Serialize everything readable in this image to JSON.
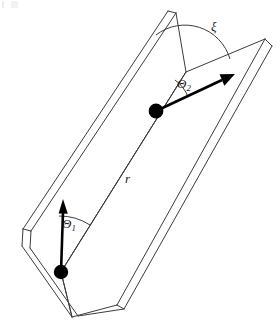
{
  "figure": {
    "type": "geometry-diagram",
    "title": "",
    "background_color": "#ffffff",
    "line_color": "#3c3c3c",
    "vector_color": "#000000",
    "particle_color": "#000000",
    "label_color": "#1a1a1a"
  },
  "labels": {
    "theta1": {
      "symbol": "Θ",
      "subscript": "1",
      "x": 71,
      "y": 222
    },
    "theta2": {
      "symbol": "Θ",
      "subscript": "2",
      "x": 186,
      "y": 82
    },
    "xi": {
      "symbol": "ξ",
      "subscript": "",
      "x": 215,
      "y": 26
    },
    "r": {
      "symbol": "r",
      "subscript": "",
      "x": 129,
      "y": 178
    }
  },
  "particles": [
    {
      "name": "lower-particle",
      "cx": 61,
      "cy": 272,
      "r": 7.2
    },
    {
      "name": "upper-particle",
      "cx": 156,
      "cy": 111,
      "r": 7.4
    }
  ],
  "vectors": [
    {
      "name": "theta1-vector",
      "from_x": 61,
      "from_y": 272,
      "to_x": 63,
      "to_y": 204,
      "head_length": 14,
      "head_width": 9
    },
    {
      "name": "theta2-vector",
      "from_x": 156,
      "from_y": 111,
      "to_x": 232,
      "to_y": 75,
      "head_length": 15,
      "head_width": 10
    }
  ],
  "fold_line": {
    "name": "fold-line-r",
    "x1": 61,
    "y1": 272,
    "x2": 156,
    "y2": 111,
    "extends_to_x": 186,
    "extends_to_y": 72
  },
  "arcs": [
    {
      "name": "theta1-arc",
      "center_x": 61,
      "center_y": 272,
      "radius": 56,
      "start_deg": 268,
      "end_deg": 301
    },
    {
      "name": "theta2-arc",
      "center_x": 156,
      "center_y": 111,
      "radius": 36,
      "start_deg": 301,
      "end_deg": 334
    },
    {
      "name": "xi-arc",
      "center_x": 185,
      "center_y": 72,
      "radius": 47,
      "start_deg": 232,
      "end_deg": 344
    }
  ],
  "panels": {
    "left_panel": {
      "name": "left-panel",
      "outline": "186,72 168,11 23,229 61,272",
      "thickness_offset": {
        "dx": 6,
        "dy": 6
      }
    },
    "right_panel": {
      "name": "right-panel",
      "outline": "186,72 265,39 117,305 61,272",
      "thickness_offset": {
        "dx": 7,
        "dy": 7
      }
    }
  },
  "geometry_notes": {
    "projection": "oblique / parallel",
    "fold_angle_label": "ξ",
    "panel_count": 2,
    "particle_count": 2
  }
}
